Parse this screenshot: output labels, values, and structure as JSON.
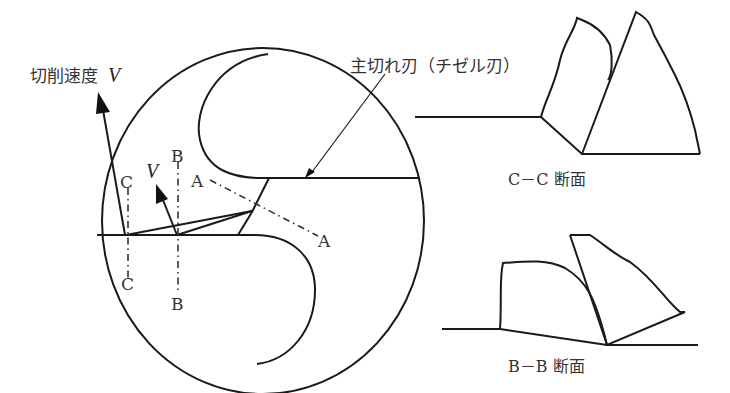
{
  "diagram": {
    "type": "drill chisel edge cutting diagram",
    "labels": {
      "cutting_speed": "切削速度",
      "cutting_speed_symbol": "V",
      "local_speed_symbol": "V",
      "main_edge": "主切れ刃（チゼル刃）",
      "section_a_top": "A",
      "section_a_bottom": "A",
      "section_b_top": "B",
      "section_b_bottom": "B",
      "section_c_top": "C",
      "section_c_bottom": "C",
      "section_cc_caption": "C－C 断面",
      "section_bb_caption": "B－B 断面"
    },
    "colors": {
      "line": "#1a1a1a",
      "text": "#333333",
      "background": "#ffffff"
    }
  }
}
